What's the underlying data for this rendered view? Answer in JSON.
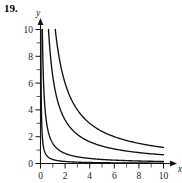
{
  "figure": {
    "problem_number": "19.",
    "background_color": "#ffffff",
    "ink_color": "#111111"
  },
  "chart_data": {
    "type": "line",
    "title": "",
    "subtitle": "",
    "xlabel": "",
    "ylabel": "y",
    "axis_names": {
      "x": "x",
      "y": "y"
    },
    "xlim": [
      0,
      10
    ],
    "ylim": [
      0,
      10
    ],
    "grid": false,
    "legend": "none",
    "x_major_ticks": [
      0,
      2,
      4,
      6,
      8,
      10
    ],
    "x_major_tick_labels": [
      "0",
      "2",
      "4",
      "6",
      "8",
      "10"
    ],
    "x_minor_ticks": [
      1,
      3,
      5,
      7,
      9
    ],
    "y_major_ticks": [
      0,
      2,
      4,
      6,
      8,
      10
    ],
    "y_major_tick_labels": [
      "0",
      "2",
      "4",
      "6",
      "8",
      "10"
    ],
    "y_minor_ticks": [
      1,
      3,
      5,
      7,
      9
    ],
    "annotations": [],
    "series": [
      {
        "name": "y = 0.3/x",
        "k": 0.3,
        "x": [
          0.03,
          0.06,
          0.1,
          0.15,
          0.2,
          0.3,
          0.4,
          0.5,
          0.6,
          0.8,
          1.0,
          1.25,
          1.5,
          2.0,
          2.5,
          3.0,
          4.0,
          5.0,
          6.0,
          7.0,
          8.0,
          9.0,
          10.0
        ],
        "values": [
          10.0,
          5.0,
          3.0,
          2.0,
          1.5,
          1.0,
          0.75,
          0.6,
          0.5,
          0.375,
          0.3,
          0.24,
          0.2,
          0.15,
          0.12,
          0.1,
          0.075,
          0.06,
          0.05,
          0.043,
          0.038,
          0.033,
          0.03
        ]
      },
      {
        "name": "y = 1.5/x",
        "k": 1.5,
        "x": [
          0.15,
          0.2,
          0.25,
          0.3,
          0.4,
          0.5,
          0.6,
          0.75,
          1.0,
          1.25,
          1.5,
          2.0,
          2.5,
          3.0,
          4.0,
          5.0,
          6.0,
          7.0,
          8.0,
          9.0,
          10.0
        ],
        "values": [
          10.0,
          7.5,
          6.0,
          5.0,
          3.75,
          3.0,
          2.5,
          2.0,
          1.5,
          1.2,
          1.0,
          0.75,
          0.6,
          0.5,
          0.375,
          0.3,
          0.25,
          0.214,
          0.188,
          0.167,
          0.15
        ]
      },
      {
        "name": "y = 6.5/x",
        "k": 6.5,
        "x": [
          0.65,
          0.8,
          1.0,
          1.3,
          1.6,
          2.0,
          2.5,
          3.0,
          3.5,
          4.0,
          5.0,
          6.0,
          7.0,
          8.0,
          9.0,
          10.0
        ],
        "values": [
          10.0,
          8.13,
          6.5,
          5.0,
          4.06,
          3.25,
          2.6,
          2.17,
          1.86,
          1.63,
          1.3,
          1.08,
          0.93,
          0.81,
          0.72,
          0.65
        ]
      },
      {
        "name": "y = 12/x",
        "k": 12,
        "x": [
          1.2,
          1.5,
          2.0,
          2.4,
          3.0,
          3.5,
          4.0,
          5.0,
          6.0,
          7.0,
          8.0,
          9.0,
          10.0
        ],
        "values": [
          10.0,
          8.0,
          6.0,
          5.0,
          4.0,
          3.43,
          3.0,
          2.4,
          2.0,
          1.71,
          1.5,
          1.33,
          1.2
        ]
      }
    ]
  }
}
